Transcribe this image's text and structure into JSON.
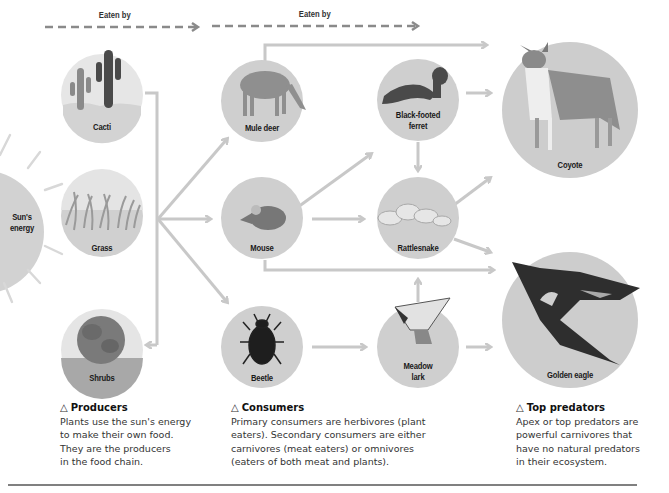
{
  "header": {
    "eaten_by_left": "Eaten by",
    "eaten_by_right": "Eaten by"
  },
  "sun": {
    "label_line1": "Sun's",
    "label_line2": "energy"
  },
  "producers": [
    {
      "id": "cacti",
      "label": "Cacti"
    },
    {
      "id": "grass",
      "label": "Grass"
    },
    {
      "id": "shrubs",
      "label": "Shrubs"
    }
  ],
  "consumers": [
    {
      "id": "mule-deer",
      "label": "Mule deer"
    },
    {
      "id": "mouse",
      "label": "Mouse"
    },
    {
      "id": "beetle",
      "label": "Beetle"
    },
    {
      "id": "ferret",
      "label_line1": "Black-footed",
      "label_line2": "ferret"
    },
    {
      "id": "rattlesnake",
      "label": "Rattlesnake"
    },
    {
      "id": "meadowlark",
      "label_line1": "Meadow",
      "label_line2": "lark"
    }
  ],
  "predators": [
    {
      "id": "coyote",
      "label": "Coyote"
    },
    {
      "id": "golden-eagle",
      "label": "Golden eagle"
    }
  ],
  "captions": {
    "producers": {
      "icon": "△",
      "title": "Producers",
      "lines": [
        "Plants use the sun's energy",
        "to make their own food.",
        "They are the producers",
        "in the food chain."
      ]
    },
    "consumers": {
      "icon": "△",
      "title": "Consumers",
      "lines": [
        "Primary consumers are herbivores (plant",
        "eaters). Secondary consumers are either",
        "carnivores (meat eaters) or omnivores",
        "(eaters of both meat and plants)."
      ]
    },
    "predators": {
      "icon": "△",
      "title": "Top predators",
      "lines": [
        "Apex or top predators are",
        "powerful carnivores that",
        "have no natural predators",
        "in their ecosystem."
      ]
    }
  },
  "colors": {
    "circle": "#cfcfcf",
    "arrow": "#c8c8c8",
    "dashed": "#8a8a8a",
    "sun": "#d2d2d2",
    "rule": "#808080"
  }
}
